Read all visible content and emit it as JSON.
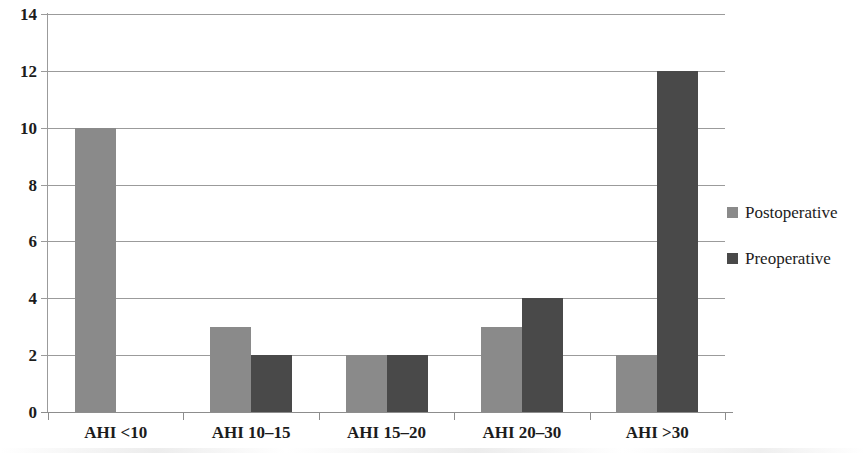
{
  "chart_data": {
    "type": "bar",
    "title": "",
    "subtitle": "",
    "xlabel": "",
    "ylabel": "",
    "categories": [
      "AHI <10",
      "AHI 10–15",
      "AHI 15–20",
      "AHI 20–30",
      "AHI >30"
    ],
    "series": [
      {
        "name": "Postoperative",
        "color": "#8a8a8a",
        "values": [
          10,
          3,
          2,
          3,
          2
        ]
      },
      {
        "name": "Preoperative",
        "color": "#494949",
        "values": [
          0,
          2,
          2,
          4,
          12
        ]
      }
    ],
    "ylim": [
      0,
      14
    ],
    "ytick_step": 2,
    "yticks": [
      "14",
      "12",
      "10",
      "8",
      "6",
      "4",
      "2",
      "0"
    ],
    "ytick_values": [
      14,
      12,
      10,
      8,
      6,
      4,
      2,
      0
    ],
    "grid": true,
    "grid_axis": "y",
    "legend_position": "right"
  },
  "legend": {
    "items": [
      {
        "label": "Postoperative",
        "color": "#8a8a8a"
      },
      {
        "label": "Preoperative",
        "color": "#494949"
      }
    ]
  },
  "colors": {
    "postoperative": "#8a8a8a",
    "preoperative": "#494949",
    "gridline": "#9b9b9b",
    "axis": "#8d8d8d",
    "text": "#1c1c1c",
    "background": "#ffffff"
  }
}
